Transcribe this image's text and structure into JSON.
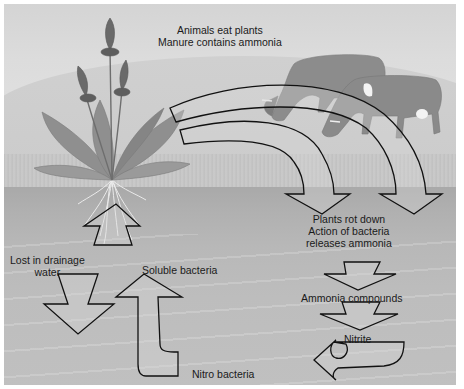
{
  "diagram": {
    "style": "grayscale illustration",
    "labels": {
      "animals_line1": "Animals eat plants",
      "animals_line2": "Manure contains ammonia",
      "decay_line1": "Plants rot down",
      "decay_line2": "Action of bacteria",
      "decay_line3": "releases ammonia",
      "ammonia_compounds": "Ammonia compounds",
      "nitrite": "Nitrite",
      "nitro_bacteria": "Nitro bacteria",
      "soluble_bacteria": "Soluble bacteria",
      "lost_line1": "Lost in drainage",
      "lost_line2": "water"
    },
    "illustrations": [
      "plantain-plant",
      "cow-left",
      "cow-right",
      "roots",
      "soil",
      "grass"
    ],
    "arrows": [
      {
        "name": "plant-to-cows-curved-arrow-outer",
        "from": "plant",
        "to": "decay"
      },
      {
        "name": "plant-to-decay-curved-arrow-inner",
        "from": "plant",
        "to": "decay"
      },
      {
        "name": "decay-to-ammonia-arrow",
        "from": "decay",
        "to": "ammonia compounds"
      },
      {
        "name": "ammonia-to-nitrite-arrow",
        "from": "ammonia compounds",
        "to": "nitrite"
      },
      {
        "name": "nitrite-to-nitro-bacteria-arrow",
        "from": "nitrite",
        "to": "nitro bacteria"
      },
      {
        "name": "nitro-to-soluble-arrow",
        "from": "nitro bacteria",
        "to": "soluble bacteria"
      },
      {
        "name": "soil-to-roots-arrow",
        "from": "soil",
        "to": "plant roots"
      },
      {
        "name": "drainage-loss-arrow",
        "from": "soil",
        "to": "drainage water"
      }
    ],
    "colors": {
      "sky": "#dcdcdc",
      "soil": "#b4b4b4",
      "outline": "#111111",
      "text": "#1a1a1a"
    }
  }
}
